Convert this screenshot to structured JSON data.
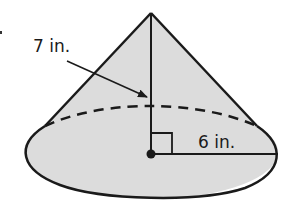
{
  "diagram": {
    "type": "right circular cone",
    "labels": {
      "slant_height": "7 in.",
      "radius": "6 in."
    },
    "colors": {
      "fill": "#dcdcdc",
      "stroke": "#1a1a1a",
      "background": "#ffffff"
    },
    "geometry": {
      "apex": [
        151,
        13
      ],
      "base_center": [
        151,
        154
      ],
      "base_rx": 127,
      "base_ry": 47,
      "right_angle_marker_size": 21
    }
  }
}
